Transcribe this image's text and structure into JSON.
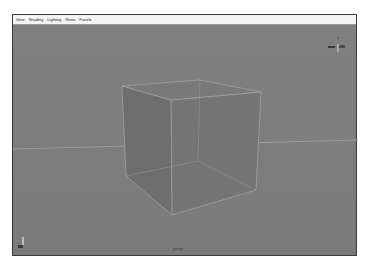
{
  "menubar": {
    "items": [
      {
        "label": "View"
      },
      {
        "label": "Shading"
      },
      {
        "label": "Lighting"
      },
      {
        "label": "Show"
      },
      {
        "label": "Panels"
      }
    ]
  },
  "viewport": {
    "camera_label": "persp",
    "background": "#7d7d7d",
    "object": "cube",
    "view_cube": {
      "top_label": "Y"
    }
  }
}
